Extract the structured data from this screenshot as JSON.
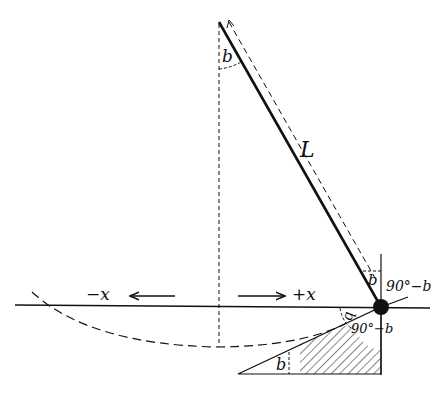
{
  "diagram": {
    "type": "pendulum-geometry",
    "labels": {
      "length": "L",
      "angle_top": "b",
      "angle_bob_left": "b",
      "angle_bob_right": "90°−b",
      "angle_lower_left": "b",
      "angle_lower_right": "90°−b",
      "angle_triangle": "b",
      "neg_x": "−x",
      "pos_x": "+x"
    },
    "colors": {
      "ink": "#111111",
      "background": "#ffffff"
    }
  }
}
